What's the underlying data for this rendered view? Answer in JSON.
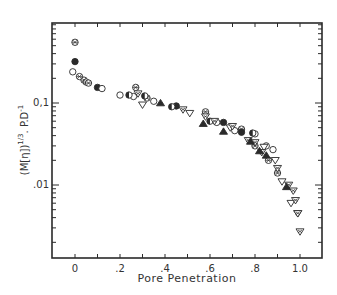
{
  "chart_data": {
    "type": "scatter",
    "title": "",
    "xlabel": "Pore Penetration",
    "ylabel": "(M[η])^1/3 . P.D^-1",
    "ylabel_parts": {
      "main": "(M[η])",
      "sup": "1/3",
      "rest": ". P.D",
      "sup2": "-1"
    },
    "xscale": "linear",
    "yscale": "log",
    "xlim": [
      -0.1,
      1.1
    ],
    "ylim": [
      0.0013,
      0.9
    ],
    "x_ticks": [
      0,
      0.1,
      0.2,
      0.3,
      0.4,
      0.5,
      0.6,
      0.7,
      0.8,
      0.9,
      1.0
    ],
    "x_tick_labels": [
      {
        "value": 0,
        "label": "0"
      },
      {
        "value": 0.2,
        "label": ".2"
      },
      {
        "value": 0.4,
        "label": ".4"
      },
      {
        "value": 0.6,
        "label": ".6"
      },
      {
        "value": 0.8,
        "label": ".8"
      },
      {
        "value": 1.0,
        "label": "1.0"
      }
    ],
    "y_tick_labels": [
      {
        "value": 0.1,
        "label": "0.1"
      },
      {
        "value": 0.01,
        "label": ".01"
      }
    ],
    "grid": false,
    "legend": null,
    "series": [
      {
        "name": "crossed-circle",
        "marker": "circle-cross",
        "points": [
          [
            0.0,
            0.55
          ],
          [
            0.02,
            0.21
          ],
          [
            0.04,
            0.19
          ],
          [
            0.05,
            0.18
          ],
          [
            0.06,
            0.175
          ],
          [
            0.27,
            0.155
          ],
          [
            0.32,
            0.115
          ],
          [
            0.58,
            0.078
          ],
          [
            0.74,
            0.048
          ],
          [
            0.8,
            0.03
          ],
          [
            0.86,
            0.02
          ],
          [
            0.9,
            0.014
          ]
        ]
      },
      {
        "name": "filled-circle",
        "marker": "circle-filled",
        "points": [
          [
            0.0,
            0.32
          ],
          [
            0.1,
            0.155
          ],
          [
            0.45,
            0.092
          ],
          [
            0.66,
            0.058
          ],
          [
            0.74,
            0.044
          ]
        ]
      },
      {
        "name": "open-circle",
        "marker": "circle-open",
        "points": [
          [
            -0.01,
            0.24
          ],
          [
            0.12,
            0.15
          ],
          [
            0.2,
            0.125
          ],
          [
            0.26,
            0.12
          ],
          [
            0.35,
            0.105
          ],
          [
            0.63,
            0.058
          ],
          [
            0.71,
            0.046
          ],
          [
            0.8,
            0.042
          ],
          [
            0.85,
            0.03
          ],
          [
            0.88,
            0.027
          ]
        ]
      },
      {
        "name": "half-filled-circle",
        "marker": "circle-half",
        "points": [
          [
            0.24,
            0.125
          ],
          [
            0.31,
            0.122
          ],
          [
            0.43,
            0.09
          ],
          [
            0.6,
            0.06
          ],
          [
            0.79,
            0.043
          ]
        ]
      },
      {
        "name": "open-triangle-down",
        "marker": "triangle-down-open",
        "points": [
          [
            0.3,
            0.095
          ],
          [
            0.51,
            0.075
          ],
          [
            0.69,
            0.05
          ],
          [
            0.84,
            0.029
          ],
          [
            0.89,
            0.02
          ],
          [
            0.92,
            0.011
          ],
          [
            0.96,
            0.006
          ],
          [
            0.99,
            0.0045
          ]
        ]
      },
      {
        "name": "crossed-triangle-down",
        "marker": "triangle-down-cross",
        "points": [
          [
            0.28,
            0.13
          ],
          [
            0.48,
            0.083
          ],
          [
            0.58,
            0.068
          ],
          [
            0.62,
            0.06
          ],
          [
            0.7,
            0.052
          ],
          [
            0.77,
            0.035
          ],
          [
            0.8,
            0.033
          ],
          [
            0.83,
            0.025
          ],
          [
            0.9,
            0.016
          ],
          [
            0.95,
            0.01
          ],
          [
            0.97,
            0.0085
          ],
          [
            0.98,
            0.0065
          ],
          [
            0.99,
            0.0045
          ],
          [
            1.0,
            0.0027
          ]
        ]
      },
      {
        "name": "filled-triangle-up",
        "marker": "triangle-up-filled",
        "points": [
          [
            0.38,
            0.1
          ],
          [
            0.57,
            0.056
          ],
          [
            0.66,
            0.045
          ],
          [
            0.78,
            0.034
          ],
          [
            0.82,
            0.026
          ],
          [
            0.85,
            0.023
          ],
          [
            0.94,
            0.0095
          ]
        ]
      }
    ]
  },
  "layout": {
    "plot_left": 52,
    "plot_right": 322,
    "plot_top": 23,
    "plot_bottom": 258,
    "x0_px": 75,
    "x_px_per_unit": 225,
    "y_ref_value": 0.1,
    "y_ref_px": 103,
    "y_px_per_decade": 82
  }
}
